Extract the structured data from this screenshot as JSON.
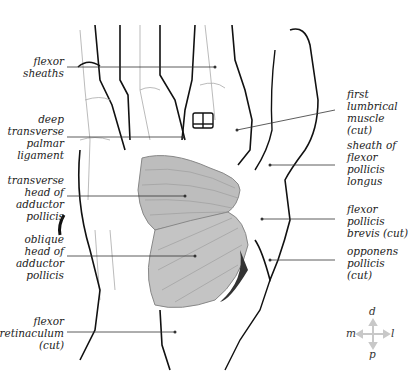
{
  "figure": {
    "colors": {
      "muscle_fill": "#b9b9b9",
      "muscle_light": "#d6d6d6",
      "outline": "#111111",
      "fine_line": "#999999",
      "leader_line": "#333333",
      "compass": "#c8c8c8"
    }
  },
  "labels_left": [
    {
      "id": "flexor-sheaths",
      "text": "flexor\nsheaths"
    },
    {
      "id": "deep-transverse-palmar-ligament",
      "text": "deep\ntransverse\npalmar\nligament"
    },
    {
      "id": "transverse-head-adductor-pollicis",
      "text": "transverse\nhead of\nadductor\npollicis"
    },
    {
      "id": "oblique-head-adductor-pollicis",
      "text": "oblique\nhead of\nadductor\npollicis"
    },
    {
      "id": "flexor-retinaculum",
      "text": "flexor\nretinaculum\n(cut)"
    }
  ],
  "labels_right": [
    {
      "id": "first-lumbrical-muscle",
      "text": "first\nlumbrical\nmuscle\n(cut)"
    },
    {
      "id": "sheath-flexor-pollicis-longus",
      "text": "sheath of\nflexor\npollicis\nlongus"
    },
    {
      "id": "flexor-pollicis-brevis",
      "text": "flexor\npollicis\nbrevis (cut)"
    },
    {
      "id": "opponens-pollicis",
      "text": "opponens\npollicis\n(cut)"
    }
  ],
  "compass": {
    "top": "d",
    "bottom": "p",
    "left": "m",
    "right": "l"
  }
}
